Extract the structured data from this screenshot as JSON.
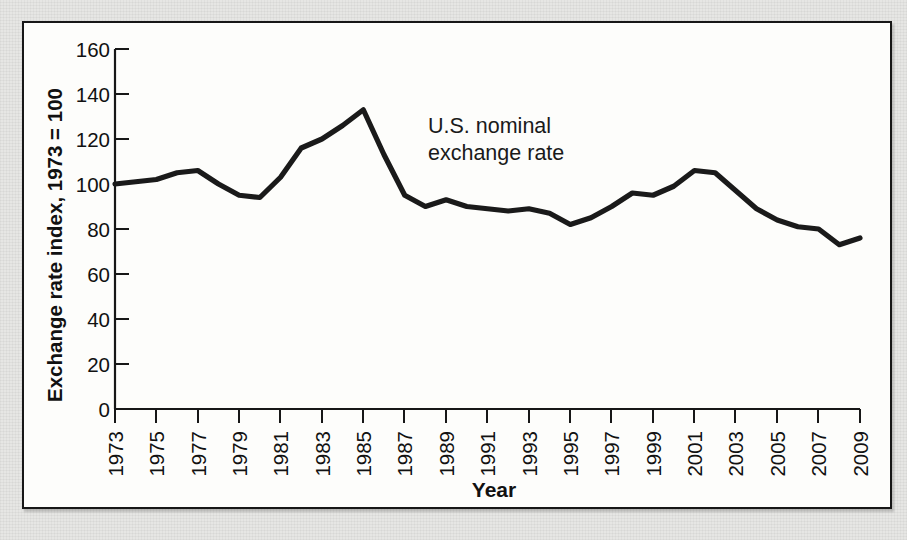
{
  "figure": {
    "panel_border_color": "#171717",
    "paper_background_color": "#e6e6e4",
    "panel_background_color": "#fdfdfb",
    "line_color": "#1a1a1a"
  },
  "chart_data": {
    "type": "line",
    "title": "",
    "subtitle": "",
    "xlabel": "Year",
    "ylabel": "Exchange rate index, 1973 = 100",
    "xlim": [
      1973,
      2009
    ],
    "ylim": [
      0,
      160
    ],
    "grid": false,
    "legend_position": "none",
    "annotations": [
      {
        "text_line_1": "U.S. nominal",
        "text_line_2": "exchange rate",
        "x": 1994,
        "y": 138
      }
    ],
    "xticks": [
      1973,
      1975,
      1977,
      1979,
      1981,
      1983,
      1985,
      1987,
      1989,
      1991,
      1993,
      1995,
      1997,
      1999,
      2001,
      2003,
      2005,
      2007,
      2009
    ],
    "xtick_labels": [
      "1973",
      "1975",
      "1977",
      "1979",
      "1981",
      "1983",
      "1985",
      "1987",
      "1989",
      "1991",
      "1993",
      "1995",
      "1997",
      "1999",
      "2001",
      "2003",
      "2005",
      "2007",
      "2009"
    ],
    "yticks": [
      0,
      20,
      40,
      60,
      80,
      100,
      120,
      140,
      160
    ],
    "ytick_labels": [
      "0",
      "20",
      "40",
      "60",
      "80",
      "100",
      "120",
      "140",
      "160"
    ],
    "series": [
      {
        "name": "U.S. nominal exchange rate",
        "x": [
          1973,
          1974,
          1975,
          1976,
          1977,
          1978,
          1979,
          1980,
          1981,
          1982,
          1983,
          1984,
          1985,
          1986,
          1987,
          1988,
          1989,
          1990,
          1991,
          1992,
          1993,
          1994,
          1995,
          1996,
          1997,
          1998,
          1999,
          2000,
          2001,
          2002,
          2003,
          2004,
          2005,
          2006,
          2007,
          2008,
          2009
        ],
        "values": [
          100,
          101,
          102,
          105,
          106,
          100,
          95,
          94,
          103,
          116,
          120,
          126,
          133,
          113,
          95,
          90,
          93,
          90,
          89,
          88,
          89,
          87,
          82,
          85,
          90,
          96,
          95,
          99,
          106,
          105,
          97,
          89,
          84,
          81,
          80,
          73,
          76
        ]
      }
    ]
  }
}
